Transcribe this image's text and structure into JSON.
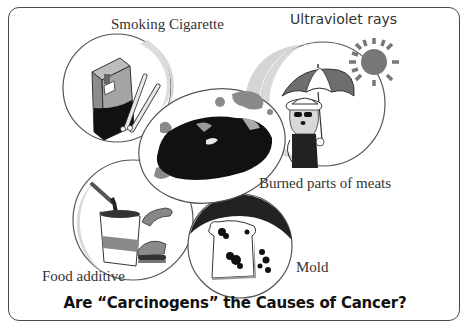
{
  "title": "Are “Carcinogens” the Causes of Cancer?",
  "labels": {
    "smoking": "Smoking Cigarette",
    "uv": "Ultraviolet rays",
    "burned": "Burned parts of meats",
    "food": "Food additive",
    "mold": "Mold"
  },
  "colors": {
    "frame": "#4a4a4a",
    "dark": "#111111",
    "mid_gray": "#8a8a8a",
    "light_gray": "#d0d0d0",
    "text": "#333333"
  }
}
